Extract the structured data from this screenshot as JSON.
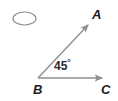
{
  "figure": {
    "type": "geometry-diagram",
    "canvas": {
      "width": 118,
      "height": 101,
      "background": "#ffffff"
    },
    "stroke_color": "#8f8f8f",
    "label_color": "#1b1b1b",
    "angle_text_color": "#2b2b2b"
  },
  "labels": {
    "point_a": "A",
    "point_b": "B",
    "point_c": "C",
    "angle_value": "45",
    "angle_degree_symbol": "°"
  },
  "shapes": {
    "ellipse": {
      "name": "answer-bubble-ellipse",
      "cx": 24.5,
      "cy": 18.5,
      "rx": 11.5,
      "ry": 6.5,
      "stroke": "#8f8f8f",
      "fill": "none"
    },
    "ray_ba": {
      "name": "ray-b-to-a",
      "x1": 38,
      "y1": 78,
      "x2": 89,
      "y2": 24,
      "stroke": "#8f8f8f",
      "arrowhead": "end"
    },
    "ray_bc": {
      "name": "ray-b-to-c",
      "x1": 38,
      "y1": 78,
      "x2": 104,
      "y2": 78,
      "stroke": "#8f8f8f",
      "arrowhead": "end"
    }
  }
}
